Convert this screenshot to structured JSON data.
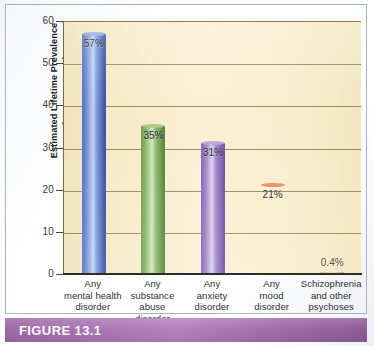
{
  "figure": {
    "caption_label": "FIGURE 13.1"
  },
  "chart_data": {
    "type": "bar",
    "title": "",
    "xlabel": "",
    "ylabel": "Estimated Lifetime Prevalence (as percentage)",
    "ylabel_line1": "Estimated Lifetime Prevalence",
    "ylabel_line2": "(as percentage)",
    "ylim": [
      0,
      60
    ],
    "ytick_values": [
      0,
      10,
      20,
      30,
      40,
      50,
      60
    ],
    "ytick_labels": [
      "0",
      "10",
      "20",
      "30",
      "40",
      "50",
      "60"
    ],
    "grid": true,
    "grid_orientation": "horizontal",
    "legend": false,
    "categories": [
      "Any mental health disorder",
      "Any substance abuse disorder",
      "Any anxiety disorder",
      "Any mood disorder",
      "Schizophrenia and other psychoses"
    ],
    "category_lines": [
      [
        "Any",
        "mental health",
        "disorder"
      ],
      [
        "Any",
        "substance",
        "abuse",
        "disorder"
      ],
      [
        "Any",
        "anxiety",
        "disorder"
      ],
      [
        "Any",
        "mood",
        "disorder"
      ],
      [
        "Schizophrenia",
        "and other",
        "psychoses"
      ]
    ],
    "values": [
      57,
      35,
      31,
      21,
      0.4
    ],
    "value_labels": [
      "57%",
      "35%",
      "31%",
      "21%",
      "0.4%"
    ],
    "bar_colors": [
      "#4f6fc0",
      "#6f9e4e",
      "#8366b4",
      "#c23a18",
      "#d9b85c"
    ],
    "color_names": [
      "blue",
      "green",
      "purple",
      "red",
      "gold"
    ]
  },
  "colors": {
    "plot_background": "#f8ecca",
    "gridline": "#8a7a46",
    "axis": "#2c2c2c",
    "caption_band": "#a873b2",
    "caption_text": "#ffffff",
    "panel_border": "#a8b3c8"
  }
}
